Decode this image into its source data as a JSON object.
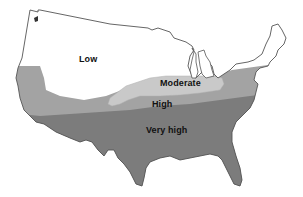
{
  "map": {
    "subject": "Contiguous United States risk zones",
    "zones": [
      {
        "id": "low",
        "label": "Low",
        "color": "#ffffff",
        "label_x": 79,
        "label_y": 58
      },
      {
        "id": "moderate",
        "label": "Moderate",
        "color": "#c9c9c9",
        "label_x": 160,
        "label_y": 80
      },
      {
        "id": "high",
        "label": "High",
        "color": "#a3a3a3",
        "label_x": 152,
        "label_y": 99
      },
      {
        "id": "very_high",
        "label": "Very high",
        "color": "#7c7c7c",
        "label_x": 145,
        "label_y": 127
      }
    ],
    "outline_color": "#555555"
  }
}
